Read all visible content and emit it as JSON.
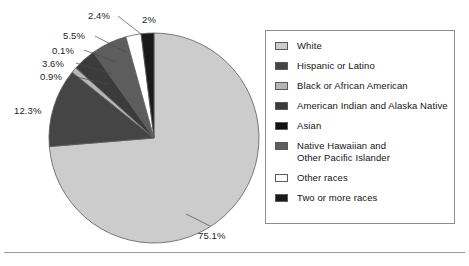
{
  "chart_data": {
    "type": "pie",
    "title": "",
    "subtitle": "",
    "xlabel": "",
    "ylabel": "",
    "legend_position": "right",
    "grid": false,
    "categories": [
      "White",
      "Hispanic or Latino",
      "Black or African American",
      "American Indian and Alaska Native",
      "Asian",
      "Native Hawaiian and Other Pacific Islander",
      "Other races",
      "Two or more races"
    ],
    "values": [
      75.1,
      12.3,
      0.9,
      3.6,
      0.1,
      5.5,
      2.4,
      2.0
    ],
    "value_labels": [
      "75.1%",
      "12.3%",
      "0.9%",
      "3.6%",
      "0.1%",
      "5.5%",
      "2.4%",
      "2%"
    ],
    "colors": [
      "#cccccc",
      "#454545",
      "#b6b6b6",
      "#3b3b3b",
      "#111111",
      "#5d5d5d",
      "#ffffff",
      "#1a1a1a"
    ],
    "units": "percent"
  },
  "pie": {
    "labels": [
      {
        "text": "2.4%",
        "x": 88,
        "y": 10
      },
      {
        "text": "2%",
        "x": 142,
        "y": 14
      },
      {
        "text": "5.5%",
        "x": 63,
        "y": 30
      },
      {
        "text": "0.1%",
        "x": 52,
        "y": 45
      },
      {
        "text": "3.6%",
        "x": 42,
        "y": 58
      },
      {
        "text": "0.9%",
        "x": 40,
        "y": 71
      },
      {
        "text": "12.3%",
        "x": 14,
        "y": 105
      },
      {
        "text": "75.1%",
        "x": 198,
        "y": 230
      }
    ]
  },
  "legend": {
    "items": [
      {
        "label": "White",
        "label_line2": "",
        "color": "#cccccc",
        "swatch": "legend-swatch-white"
      },
      {
        "label": "Hispanic or Latino",
        "label_line2": "",
        "color": "#454545",
        "swatch": "legend-swatch-hispanic"
      },
      {
        "label": "Black or African American",
        "label_line2": "",
        "color": "#b6b6b6",
        "swatch": "legend-swatch-black"
      },
      {
        "label": "American Indian and Alaska Native",
        "label_line2": "",
        "color": "#3b3b3b",
        "swatch": "legend-swatch-amerindian"
      },
      {
        "label": "Asian",
        "label_line2": "",
        "color": "#111111",
        "swatch": "legend-swatch-asian"
      },
      {
        "label": "Native Hawaiian and",
        "label_line2": "Other Pacific Islander",
        "color": "#5d5d5d",
        "swatch": "legend-swatch-hawaiian"
      },
      {
        "label": "Other races",
        "label_line2": "",
        "color": "#ffffff",
        "swatch": "legend-swatch-other"
      },
      {
        "label": "Two or more races",
        "label_line2": "",
        "color": "#1a1a1a",
        "swatch": "legend-swatch-twoormore"
      }
    ]
  }
}
